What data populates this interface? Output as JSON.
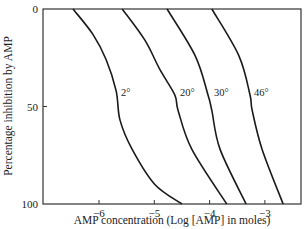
{
  "chart_data": {
    "type": "line",
    "title": "",
    "xlabel": "AMP concentration (Log [AMP] in moles)",
    "ylabel": "Percentage inhibition by AMP",
    "xlim": [
      -6.8,
      -2.5
    ],
    "ylim": [
      0,
      100
    ],
    "y_inverted": true,
    "x_ticks": [
      -6,
      -5,
      -4,
      -3
    ],
    "x_tick_labels": [
      "−6",
      "−5",
      "−4",
      "−3"
    ],
    "y_ticks": [
      0,
      50,
      100
    ],
    "y_tick_labels": [
      "0",
      "50",
      "100"
    ],
    "grid": false,
    "legend": "inline curve labels",
    "series": [
      {
        "name": "2°",
        "label": "2°",
        "x": [
          -6.47,
          -6.11,
          -5.87,
          -5.69,
          -5.62,
          -5.4,
          -4.99,
          -4.5
        ],
        "y": [
          0,
          13,
          26,
          42,
          57,
          72,
          90,
          100
        ]
      },
      {
        "name": "20°",
        "label": "20°",
        "x": [
          -5.58,
          -5.17,
          -4.9,
          -4.63,
          -4.57,
          -4.32,
          -3.69
        ],
        "y": [
          0,
          16,
          31,
          44,
          52,
          72,
          100
        ]
      },
      {
        "name": "30°",
        "label": "30°",
        "x": [
          -4.77,
          -4.26,
          -4.03,
          -3.96,
          -3.81,
          -3.34
        ],
        "y": [
          0,
          24,
          44,
          52,
          72,
          100
        ]
      },
      {
        "name": "46°",
        "label": "46°",
        "x": [
          -3.96,
          -3.47,
          -3.27,
          -3.23,
          -3.05,
          -2.67
        ],
        "y": [
          0,
          24,
          44,
          52,
          72,
          100
        ]
      }
    ]
  },
  "layout": {
    "plot_left": 43,
    "plot_right": 301,
    "plot_top": 9,
    "plot_bottom": 204,
    "x_px_at_minus6": 99,
    "px_per_unit": 55.3,
    "label_positions": [
      {
        "x": 121,
        "y": 96
      },
      {
        "x": 180,
        "y": 96
      },
      {
        "x": 214,
        "y": 96
      },
      {
        "x": 254,
        "y": 96
      }
    ],
    "line_color": "#1a1a1a"
  }
}
